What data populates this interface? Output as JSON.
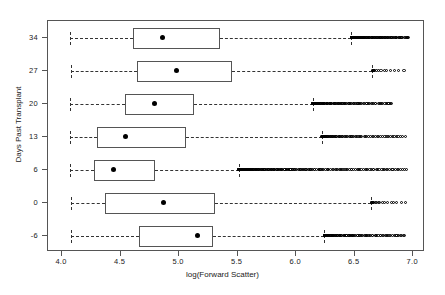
{
  "chart_data": {
    "type": "boxplot",
    "title": "",
    "xlabel": "log(Forward Scatter)",
    "ylabel": "Days Past Transplant",
    "xlim": [
      3.88,
      7.1
    ],
    "xticks": [
      4.0,
      4.5,
      5.0,
      5.5,
      6.0,
      6.5,
      7.0
    ],
    "xtick_labels": [
      "4.0",
      "4.5",
      "5.0",
      "5.5",
      "6.0",
      "6.5",
      "7.0"
    ],
    "ytick_labels": [
      "34",
      "27",
      "20",
      "13",
      "6",
      "0",
      "-6"
    ],
    "grid": false,
    "legend": null,
    "orientation": "horizontal",
    "box_color": "#555555",
    "mean_marker": "filled-circle",
    "outlier_marker": "open-circle",
    "whisker_style": "dashed",
    "groups": [
      {
        "label": "34",
        "whisker_low": 4.07,
        "q1": 4.61,
        "median": 4.61,
        "mean": 4.86,
        "q3": 5.35,
        "whisker_high": 6.47,
        "outlier_range": [
          6.47,
          6.96
        ],
        "outlier_count": 120
      },
      {
        "label": "27",
        "whisker_low": 4.08,
        "q1": 4.64,
        "median": 4.64,
        "mean": 4.98,
        "q3": 5.45,
        "whisker_high": 6.65,
        "outlier_range": [
          6.65,
          6.92
        ],
        "outlier_count": 14
      },
      {
        "label": "20",
        "whisker_low": 4.07,
        "q1": 4.54,
        "median": 4.54,
        "mean": 4.79,
        "q3": 5.13,
        "whisker_high": 6.14,
        "outlier_range": [
          6.14,
          6.82
        ],
        "outlier_count": 110
      },
      {
        "label": "13",
        "whisker_low": 4.07,
        "q1": 4.3,
        "median": 4.3,
        "mean": 4.54,
        "q3": 5.06,
        "whisker_high": 6.22,
        "outlier_range": [
          6.22,
          6.93
        ],
        "outlier_count": 80
      },
      {
        "label": "6",
        "whisker_low": 4.07,
        "q1": 4.27,
        "median": 4.27,
        "mean": 4.44,
        "q3": 4.79,
        "whisker_high": 5.51,
        "outlier_range": [
          5.51,
          6.94
        ],
        "outlier_count": 190
      },
      {
        "label": "0",
        "whisker_low": 4.08,
        "q1": 4.37,
        "median": 4.37,
        "mean": 4.87,
        "q3": 5.31,
        "whisker_high": 6.64,
        "outlier_range": [
          6.64,
          6.93
        ],
        "outlier_count": 18
      },
      {
        "label": "-6",
        "whisker_low": 4.08,
        "q1": 4.66,
        "median": 4.66,
        "mean": 5.16,
        "q3": 5.29,
        "whisker_high": 6.24,
        "outlier_range": [
          6.24,
          6.93
        ],
        "outlier_count": 105
      }
    ]
  }
}
